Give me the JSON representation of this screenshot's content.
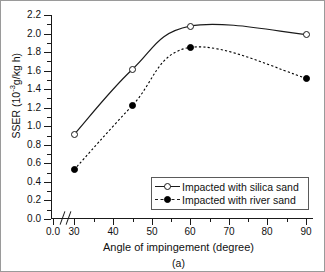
{
  "chart_data": {
    "type": "line",
    "title": "",
    "caption": "(a)",
    "xlabel": "Angle of impingement (degree)",
    "ylabel": "SSER (10",
    "ylabel_sup": "-3",
    "ylabel_tail": "g/kg h)",
    "xlim": [
      30,
      90
    ],
    "ylim": [
      0.0,
      2.2
    ],
    "x_break_after_zero": true,
    "grid": false,
    "legend_position": "bottom-right",
    "x_tick_labels": [
      "0.0",
      "30",
      "40",
      "50",
      "60",
      "70",
      "80",
      "90"
    ],
    "y_tick_labels": [
      "0.0",
      "0.2",
      "0.4",
      "0.6",
      "0.8",
      "1.0",
      "1.2",
      "1.4",
      "1.6",
      "1.8",
      "2.0",
      "2.2"
    ],
    "x": [
      30,
      45,
      60,
      90
    ],
    "series": [
      {
        "name": "Impacted with silica sand",
        "marker": "open-circle",
        "linestyle": "solid",
        "color": "#1a1a1a",
        "values": [
          0.91,
          1.61,
          2.08,
          1.99
        ]
      },
      {
        "name": "Impacted with river sand",
        "marker": "filled-circle",
        "linestyle": "dashed",
        "color": "#000000",
        "values": [
          0.53,
          1.22,
          1.85,
          1.52
        ]
      }
    ]
  }
}
